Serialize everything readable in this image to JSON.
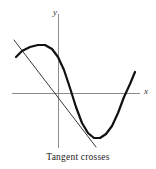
{
  "figure": {
    "caption": "Tangent crosses",
    "background_color": "#ffffff"
  },
  "axes": {
    "x_label": "x",
    "y_label": "y",
    "axis_color": "#808080",
    "x_axis": {
      "x1": 12,
      "y1": 93,
      "x2": 140,
      "y2": 93
    },
    "y_axis": {
      "x1": 58,
      "y1": 14,
      "x2": 58,
      "y2": 150
    }
  },
  "chart_data": {
    "type": "line",
    "title": "Tangent crosses",
    "xlabel": "x",
    "ylabel": "y",
    "grid": false,
    "legend": null,
    "series": [
      {
        "name": "curve",
        "role": "function-curve",
        "color": "#111111",
        "stroke_width": 2.2,
        "description": "Cubic-like curve with a local maximum at left, steep descent through the y-axis, local minimum at lower right, then rising to cross the x-axis",
        "points": [
          [
            16,
            57
          ],
          [
            22,
            51
          ],
          [
            30,
            47
          ],
          [
            38,
            45
          ],
          [
            45,
            45
          ],
          [
            52,
            49
          ],
          [
            58,
            57
          ],
          [
            64,
            70
          ],
          [
            70,
            88
          ],
          [
            76,
            107
          ],
          [
            82,
            123
          ],
          [
            88,
            133
          ],
          [
            94,
            138
          ],
          [
            100,
            138
          ],
          [
            106,
            134
          ],
          [
            112,
            126
          ],
          [
            118,
            113
          ],
          [
            124,
            97
          ],
          [
            130,
            84
          ],
          [
            135,
            72
          ]
        ],
        "features": {
          "local_maximum": [
            42,
            45
          ],
          "local_minimum": [
            97,
            138
          ],
          "x_axis_crossings": [
            [
              66,
              93
            ],
            [
              126,
              93
            ]
          ],
          "left_endpoint": [
            16,
            57
          ],
          "right_endpoint": [
            135,
            72
          ]
        }
      },
      {
        "name": "tangent",
        "role": "tangent-line",
        "color": "#3a3a3a",
        "stroke_width": 1,
        "description": "Straight tangent line that touches the curve and crosses it",
        "points": [
          [
            14,
            40
          ],
          [
            96,
            147
          ]
        ],
        "features": {
          "tangency_point": [
            22,
            50
          ],
          "crossing_point": [
            22,
            50
          ]
        }
      }
    ],
    "xlim": [
      12,
      140
    ],
    "ylim": [
      150,
      14
    ]
  }
}
